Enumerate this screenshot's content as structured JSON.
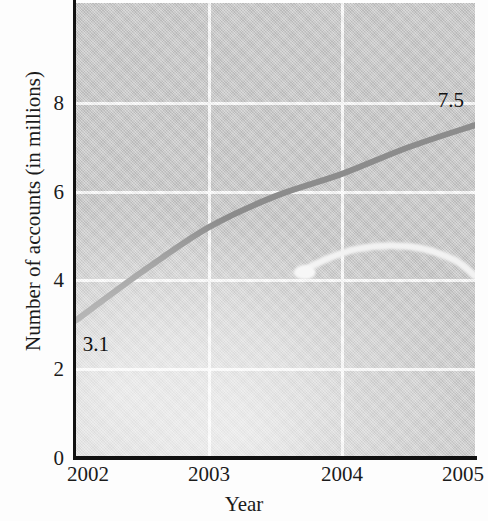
{
  "chart_data": {
    "type": "line",
    "title": "",
    "xlabel": "Year",
    "ylabel": "Number of accounts (in millions)",
    "xlim": [
      2002,
      2005
    ],
    "ylim": [
      0,
      10.25
    ],
    "x_ticks": [
      "2002",
      "2003",
      "2004",
      "2005"
    ],
    "y_ticks": [
      "0",
      "2",
      "4",
      "6",
      "8"
    ],
    "grid": true,
    "legend": "none",
    "plot_background": "#c9c9c9",
    "series": [
      {
        "name": "accounts",
        "color": "#8c8c8c",
        "style": "solid-thick",
        "x": [
          2002,
          2002.5,
          2003,
          2003.5,
          2004,
          2004.5,
          2005
        ],
        "values": [
          3.1,
          4.2,
          5.2,
          5.9,
          6.4,
          7.0,
          7.5
        ]
      },
      {
        "name": "secondary-highlight",
        "color": "#f2f2f2",
        "style": "solid-thick-light",
        "x": [
          2003.72,
          2003.9,
          2004.1,
          2004.35,
          2004.6,
          2004.85,
          2005
        ],
        "values": [
          4.25,
          4.5,
          4.7,
          4.78,
          4.72,
          4.45,
          4.1
        ]
      }
    ],
    "annotations": [
      {
        "name": "start-value-label",
        "text": "3.1",
        "x": 2002.05,
        "y": 2.55
      },
      {
        "name": "end-value-label",
        "text": "7.5",
        "x": 2004.72,
        "y": 8.05
      }
    ]
  },
  "axes": {
    "y_title": "Number of accounts (in millions)",
    "x_title": "Year",
    "y_ticks": [
      {
        "label": "8",
        "value": 8
      },
      {
        "label": "6",
        "value": 6
      },
      {
        "label": "4",
        "value": 4
      },
      {
        "label": "2",
        "value": 2
      },
      {
        "label": "0",
        "value": 0
      }
    ],
    "x_ticks": [
      {
        "label": "2002",
        "value": 2002
      },
      {
        "label": "2003",
        "value": 2003
      },
      {
        "label": "2004",
        "value": 2004
      },
      {
        "label": "2005",
        "value": 2005
      }
    ]
  },
  "labels": {
    "start_value": "3.1",
    "end_value": "7.5"
  },
  "colors": {
    "plot_bg": "#c9c9c9",
    "grid": "#ffffff",
    "axis": "#111111",
    "primary_line": "#8c8c8c",
    "highlight_line": "#f2f2f2",
    "text": "#1b1b1b"
  }
}
